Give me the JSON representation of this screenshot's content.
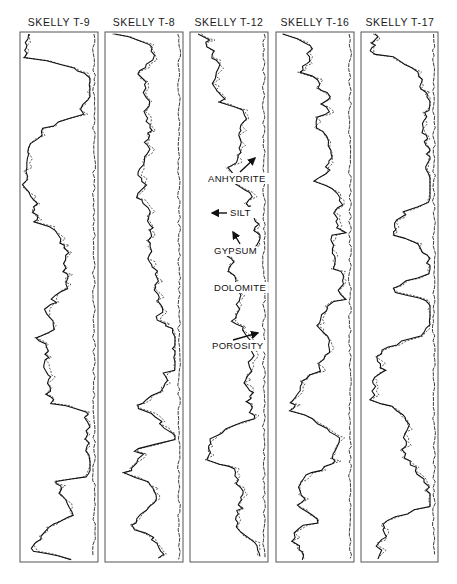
{
  "figure": {
    "type": "well log correlation diagram",
    "wells": [
      {
        "id": "t9",
        "title": "SKELLY  T-9",
        "x": 20,
        "w": 78
      },
      {
        "id": "t8",
        "title": "SKELLY  T-8",
        "x": 105,
        "w": 78
      },
      {
        "id": "t12",
        "title": "SKELLY  T-12",
        "x": 190,
        "w": 78
      },
      {
        "id": "t16",
        "title": "SKELLY  T-16",
        "x": 276,
        "w": 78
      },
      {
        "id": "t17",
        "title": "SKELLY  T-17",
        "x": 361,
        "w": 77
      }
    ],
    "annotations": [
      {
        "text": "ANHYDRITE",
        "well": "SKELLY T-12"
      },
      {
        "text": "SILT",
        "well": "SKELLY T-12"
      },
      {
        "text": "GYPSUM",
        "well": "SKELLY T-12"
      },
      {
        "text": "DOLOMITE",
        "well": "SKELLY T-12"
      },
      {
        "text": "POROSITY",
        "well": "SKELLY T-12"
      }
    ],
    "legend": {
      "solid_line": "log curve",
      "dashed_line": "companion log curve"
    },
    "colors": {
      "ink": "#111111",
      "frame": "#555555",
      "background": "#ffffff"
    }
  }
}
